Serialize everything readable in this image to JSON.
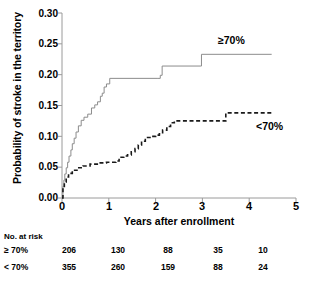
{
  "chart_data": {
    "type": "line",
    "title": "",
    "xlabel": "Years after enrollment",
    "ylabel": "Probability of stroke in the territory",
    "xlim": [
      0,
      5
    ],
    "ylim": [
      0,
      0.3
    ],
    "xticks": [
      "0",
      "1",
      "2",
      "3",
      "4",
      "5"
    ],
    "xtick_values": [
      0,
      1,
      2,
      3,
      4,
      5
    ],
    "yticks": [
      "0.00",
      "0.05",
      "0.10",
      "0.15",
      "0.20",
      "0.25",
      "0.30"
    ],
    "ytick_values": [
      0,
      0.05,
      0.1,
      0.15,
      0.2,
      0.25,
      0.3
    ],
    "grid": false,
    "legend_position": "inline-annotation",
    "series": [
      {
        "name": "≥70%",
        "style": "solid",
        "color": "#8c8c8c",
        "label_x": 3.35,
        "label_y": 0.272,
        "points": [
          [
            0.0,
            0.0
          ],
          [
            0.02,
            0.019
          ],
          [
            0.04,
            0.029
          ],
          [
            0.06,
            0.039
          ],
          [
            0.09,
            0.049
          ],
          [
            0.12,
            0.058
          ],
          [
            0.15,
            0.068
          ],
          [
            0.19,
            0.078
          ],
          [
            0.22,
            0.088
          ],
          [
            0.26,
            0.097
          ],
          [
            0.3,
            0.107
          ],
          [
            0.35,
            0.117
          ],
          [
            0.41,
            0.126
          ],
          [
            0.47,
            0.131
          ],
          [
            0.55,
            0.136
          ],
          [
            0.63,
            0.146
          ],
          [
            0.7,
            0.151
          ],
          [
            0.76,
            0.156
          ],
          [
            0.82,
            0.165
          ],
          [
            0.86,
            0.17
          ],
          [
            0.9,
            0.18
          ],
          [
            0.95,
            0.185
          ],
          [
            1.02,
            0.194
          ],
          [
            2.05,
            0.194
          ],
          [
            2.1,
            0.199
          ],
          [
            2.14,
            0.214
          ],
          [
            2.95,
            0.214
          ],
          [
            2.98,
            0.233
          ],
          [
            4.48,
            0.233
          ]
        ]
      },
      {
        "name": "<70%",
        "style": "dashed",
        "color": "#1a1a1a",
        "label_x": 3.9,
        "label_y": 0.118,
        "points": [
          [
            0.0,
            0.0
          ],
          [
            0.02,
            0.017
          ],
          [
            0.05,
            0.026
          ],
          [
            0.09,
            0.034
          ],
          [
            0.14,
            0.04
          ],
          [
            0.22,
            0.045
          ],
          [
            0.32,
            0.049
          ],
          [
            0.45,
            0.052
          ],
          [
            0.6,
            0.055
          ],
          [
            0.78,
            0.057
          ],
          [
            0.95,
            0.058
          ],
          [
            1.15,
            0.06
          ],
          [
            1.22,
            0.066
          ],
          [
            1.32,
            0.068
          ],
          [
            1.4,
            0.07
          ],
          [
            1.48,
            0.075
          ],
          [
            1.56,
            0.08
          ],
          [
            1.63,
            0.086
          ],
          [
            1.7,
            0.092
          ],
          [
            1.78,
            0.098
          ],
          [
            1.88,
            0.1
          ],
          [
            2.0,
            0.102
          ],
          [
            2.08,
            0.104
          ],
          [
            2.15,
            0.11
          ],
          [
            2.24,
            0.116
          ],
          [
            2.32,
            0.122
          ],
          [
            2.4,
            0.125
          ],
          [
            3.45,
            0.125
          ],
          [
            3.5,
            0.138
          ],
          [
            4.48,
            0.138
          ]
        ]
      }
    ],
    "risk_table": {
      "title": "No. at risk",
      "time_points": [
        0,
        1,
        2,
        3,
        4
      ],
      "rows": [
        {
          "label": "≥ 70%",
          "values": [
            "206",
            "130",
            "88",
            "35",
            "10"
          ]
        },
        {
          "label": "< 70%",
          "values": [
            "355",
            "260",
            "159",
            "88",
            "24"
          ]
        }
      ]
    }
  }
}
